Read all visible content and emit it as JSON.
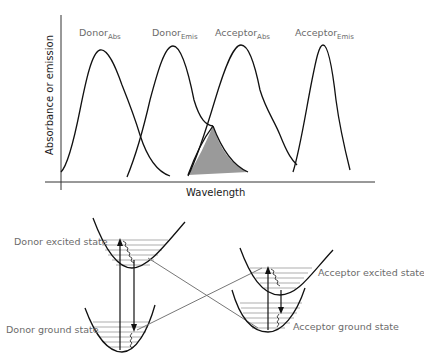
{
  "chart": {
    "y_axis_label": "Absorbance or emission",
    "x_axis_label": "Wavelength",
    "curves": [
      {
        "name": "Donor",
        "sub": "Abs"
      },
      {
        "name": "Donor",
        "sub": "Emis"
      },
      {
        "name": "Acceptor",
        "sub": "Abs"
      },
      {
        "name": "Acceptor",
        "sub": "Emis"
      }
    ],
    "overlap_fill_color": "#9a9a9a"
  },
  "energy_diagram": {
    "donor_excited_label": "Donor excited state",
    "donor_ground_label": "Donor ground state",
    "acceptor_excited_label": "Acceptor excited state",
    "acceptor_ground_label": "Acceptor ground state"
  },
  "colors": {
    "curve": "#111111",
    "label_text": "#6b6b6b",
    "transfer_line": "#777777"
  }
}
